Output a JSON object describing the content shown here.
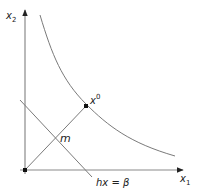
{
  "diagram": {
    "axes": {
      "x_label": "x",
      "x_subscript": "1",
      "y_label": "x",
      "y_subscript": "2"
    },
    "points": {
      "origin": {
        "label": ""
      },
      "x0": {
        "label": "x",
        "superscript": "0"
      },
      "m": {
        "label": "m"
      }
    },
    "lines": {
      "hyperplane": {
        "label": "hx = β"
      },
      "diagonal": {
        "label": ""
      },
      "curve": {
        "label": ""
      }
    },
    "colors": {
      "line": "#7a7a7a",
      "axis": "#8a8a8a",
      "point": "#111111",
      "text": "#222222"
    }
  }
}
